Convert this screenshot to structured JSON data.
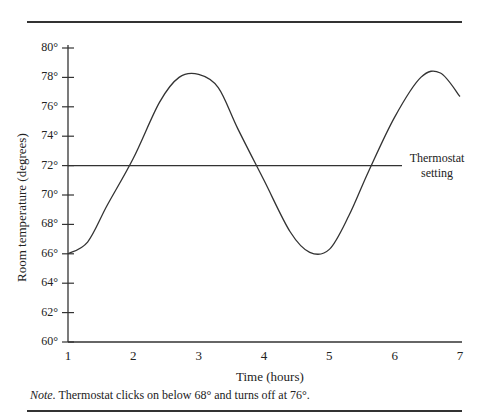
{
  "chart_data": {
    "type": "line",
    "title": "",
    "xlabel": "Time (hours)",
    "ylabel": "Room temperature (degrees)",
    "xlim": [
      1,
      7
    ],
    "ylim": [
      60,
      80
    ],
    "x_ticks": [
      "1",
      "2",
      "3",
      "4",
      "5",
      "6",
      "7"
    ],
    "y_ticks": [
      "60°",
      "62°",
      "64°",
      "66°",
      "68°",
      "70°",
      "72°",
      "74°",
      "76°",
      "78°",
      "80°"
    ],
    "grid": false,
    "legend": null,
    "series": [
      {
        "name": "Room temperature",
        "x": [
          1.0,
          1.3,
          1.6,
          2.0,
          2.4,
          2.7,
          3.0,
          3.3,
          3.6,
          4.0,
          4.4,
          4.7,
          5.0,
          5.3,
          5.6,
          6.0,
          6.4,
          6.7,
          7.0
        ],
        "y": [
          66.0,
          66.8,
          69.3,
          72.5,
          76.3,
          78.0,
          78.2,
          77.3,
          74.5,
          71.0,
          67.5,
          66.1,
          66.3,
          68.6,
          71.6,
          75.3,
          78.0,
          78.3,
          76.7
        ]
      },
      {
        "name": "Thermostat setting",
        "x": [
          1,
          7
        ],
        "y": [
          72,
          72
        ]
      }
    ],
    "annotations": [
      {
        "text": "Thermostat setting",
        "x": 6.9,
        "y": 72
      }
    ]
  },
  "labels": {
    "xlabel": "Time (hours)",
    "ylabel": "Room temperature (degrees)",
    "thermostat_line1": "Thermostat",
    "thermostat_line2": "setting",
    "note_prefix": "Note.",
    "note_text": " Thermostat clicks on below 68° and turns off at 76°."
  },
  "y_ticks": [
    "80°",
    "78°",
    "76°",
    "74°",
    "72°",
    "70°",
    "68°",
    "66°",
    "64°",
    "62°",
    "60°"
  ],
  "x_ticks": [
    "1",
    "2",
    "3",
    "4",
    "5",
    "6",
    "7"
  ]
}
